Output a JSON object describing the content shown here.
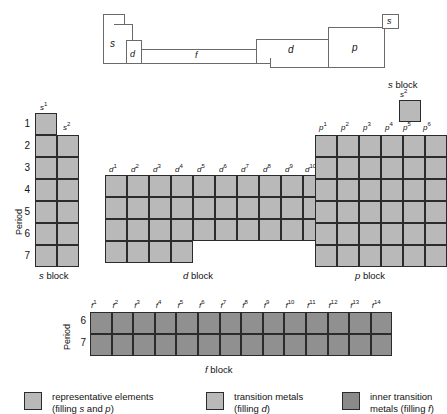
{
  "figure": {
    "colors": {
      "light_fill": "#b9b9b9",
      "dark_fill": "#909090",
      "cell_border": "#2b2b2b",
      "schematic_border": "#6a6a6a",
      "background": "#ffffff"
    }
  },
  "schematic": {
    "labels": [
      {
        "text": "s",
        "name": "schematic-label-s-left"
      },
      {
        "text": "d",
        "name": "schematic-label-d-left"
      },
      {
        "text": "f",
        "name": "schematic-label-f"
      },
      {
        "text": "d",
        "name": "schematic-label-d-right"
      },
      {
        "text": "p",
        "name": "schematic-label-p"
      },
      {
        "text": "s",
        "name": "schematic-label-s-helium"
      }
    ]
  },
  "s_block": {
    "caption": "s block",
    "period_axis_label": "Period",
    "column_labels": [
      "s1",
      "s2"
    ],
    "column_labels_rich": [
      {
        "base": "s",
        "sup": "1"
      },
      {
        "base": "s",
        "sup": "2"
      }
    ],
    "periods": [
      "1",
      "2",
      "3",
      "4",
      "5",
      "6",
      "7"
    ],
    "rows": [
      {
        "period": "1",
        "cells": [
          "s1"
        ]
      },
      {
        "period": "2",
        "cells": [
          "s1",
          "s2"
        ]
      },
      {
        "period": "3",
        "cells": [
          "s1",
          "s2"
        ]
      },
      {
        "period": "4",
        "cells": [
          "s1",
          "s2"
        ]
      },
      {
        "period": "5",
        "cells": [
          "s1",
          "s2"
        ]
      },
      {
        "period": "6",
        "cells": [
          "s1",
          "s2"
        ]
      },
      {
        "period": "7",
        "cells": [
          "s1",
          "s2"
        ]
      }
    ]
  },
  "helium_block": {
    "caption": "s block",
    "column_label_rich": {
      "base": "s",
      "sup": "2"
    },
    "cells": 1
  },
  "d_block": {
    "caption": "d block",
    "column_labels_rich": [
      {
        "base": "d",
        "sup": "1"
      },
      {
        "base": "d",
        "sup": "2"
      },
      {
        "base": "d",
        "sup": "3"
      },
      {
        "base": "d",
        "sup": "4"
      },
      {
        "base": "d",
        "sup": "5"
      },
      {
        "base": "d",
        "sup": "6"
      },
      {
        "base": "d",
        "sup": "7"
      },
      {
        "base": "d",
        "sup": "8"
      },
      {
        "base": "d",
        "sup": "9"
      },
      {
        "base": "d",
        "sup": "10"
      }
    ],
    "periods": [
      "4",
      "5",
      "6",
      "7"
    ],
    "row_column_counts": [
      10,
      10,
      10,
      4
    ]
  },
  "p_block": {
    "caption": "p block",
    "column_labels_rich": [
      {
        "base": "p",
        "sup": "1"
      },
      {
        "base": "p",
        "sup": "2"
      },
      {
        "base": "p",
        "sup": "3"
      },
      {
        "base": "p",
        "sup": "4"
      },
      {
        "base": "p",
        "sup": "5"
      },
      {
        "base": "p",
        "sup": "6"
      }
    ],
    "periods": [
      "2",
      "3",
      "4",
      "5",
      "6",
      "7"
    ],
    "row_column_counts": [
      6,
      6,
      6,
      6,
      6,
      6
    ]
  },
  "f_block": {
    "caption": "f block",
    "period_axis_label": "Period",
    "column_labels_rich": [
      {
        "base": "f",
        "sup": "1"
      },
      {
        "base": "f",
        "sup": "2"
      },
      {
        "base": "f",
        "sup": "3"
      },
      {
        "base": "f",
        "sup": "4"
      },
      {
        "base": "f",
        "sup": "5"
      },
      {
        "base": "f",
        "sup": "6"
      },
      {
        "base": "f",
        "sup": "7"
      },
      {
        "base": "f",
        "sup": "8"
      },
      {
        "base": "f",
        "sup": "9"
      },
      {
        "base": "f",
        "sup": "10"
      },
      {
        "base": "f",
        "sup": "11"
      },
      {
        "base": "f",
        "sup": "12"
      },
      {
        "base": "f",
        "sup": "13"
      },
      {
        "base": "f",
        "sup": "14"
      }
    ],
    "periods": [
      "6",
      "7"
    ],
    "row_column_counts": [
      14,
      14
    ]
  },
  "legend": {
    "items": [
      {
        "swatch": "light",
        "line1": "representative elements",
        "line2_pre": "(filling ",
        "line2_em1": "s",
        "line2_mid": " and ",
        "line2_em2": "p",
        "line2_post": ")"
      },
      {
        "swatch": "light",
        "line1": "transition metals",
        "line2_pre": "(filling ",
        "line2_em1": "d",
        "line2_mid": "",
        "line2_em2": "",
        "line2_post": ")"
      },
      {
        "swatch": "dark",
        "line1": "inner transition",
        "line2_pre": "metals (filling ",
        "line2_em1": "f",
        "line2_mid": "",
        "line2_em2": "",
        "line2_post": ")"
      }
    ]
  }
}
